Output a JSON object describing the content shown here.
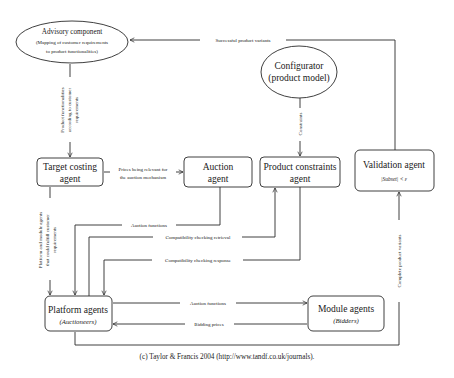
{
  "nodes": {
    "advisory": {
      "title": "Advisory component",
      "line1": "(Mapping of customer requirements",
      "line2": "to product functionalities)"
    },
    "configurator": {
      "line1": "Configurator",
      "line2": "(product model)"
    },
    "target_costing": {
      "line1": "Target costing",
      "line2": "agent"
    },
    "auction": {
      "line1": "Auction",
      "line2": "agent"
    },
    "product_constraints": {
      "line1": "Product constraints",
      "line2": "agent"
    },
    "validation": {
      "line1": "Validation agent",
      "formula": "|Subset| < ε"
    },
    "platform": {
      "line1": "Platform agents",
      "line2": "(Auctioneers)"
    },
    "module": {
      "line1": "Module agents",
      "line2": "(Bidders)"
    }
  },
  "edges": {
    "successful_variants": "Successful product variants",
    "product_functionalities": {
      "line1": "Product functionalities",
      "line2": "according to customer",
      "line3": "requirements"
    },
    "constraints": "Constraints",
    "prices_relevant": {
      "line1": "Prices being relevant for",
      "line2": "the auction mechanism"
    },
    "platform_module_agents": {
      "line1": "Platform and module agents",
      "line2": "that could fulfill customer",
      "line3": "requirements"
    },
    "auction_functions_1": "Auction functions",
    "compat_retrieval": "Compatibility checking retrieval",
    "compat_response": "Compatibility checking response",
    "complete_variants": "Complete product variants",
    "auction_functions_2": "Auction functions",
    "bidding_prices": "Bidding prices"
  },
  "footer": {
    "copyright": "(c) Taylor & Francis 2004 (http://www.tandf.co.uk/journals)."
  },
  "colors": {
    "line": "#2a2a2a",
    "background": "#ffffff",
    "text": "#1a1a1a"
  }
}
